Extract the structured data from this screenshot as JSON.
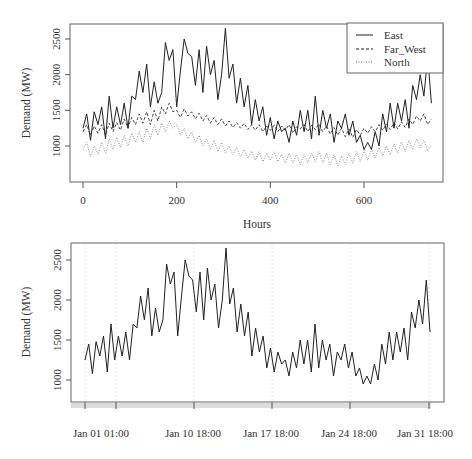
{
  "chart_data": [
    {
      "type": "line",
      "title": "",
      "xlabel": "Hours",
      "ylabel": "Demand (MW)",
      "xlim": [
        0,
        744
      ],
      "ylim": [
        700,
        2650
      ],
      "x_ticks": [
        "0",
        "200",
        "400",
        "600"
      ],
      "y_ticks": [
        "1000",
        "1500",
        "2000",
        "2500"
      ],
      "grid": false,
      "legend": {
        "position": "top-right",
        "entries": [
          {
            "label": "East",
            "style": "solid"
          },
          {
            "label": "Far_West",
            "style": "dashed"
          },
          {
            "label": "North",
            "style": "dotted"
          }
        ]
      },
      "x": [
        0,
        8,
        16,
        24,
        32,
        40,
        48,
        56,
        64,
        72,
        80,
        88,
        96,
        104,
        112,
        120,
        128,
        136,
        144,
        152,
        160,
        168,
        176,
        184,
        192,
        200,
        208,
        216,
        224,
        232,
        240,
        248,
        256,
        264,
        272,
        280,
        288,
        296,
        304,
        312,
        320,
        328,
        336,
        344,
        352,
        360,
        368,
        376,
        384,
        392,
        400,
        408,
        416,
        424,
        432,
        440,
        448,
        456,
        464,
        472,
        480,
        488,
        496,
        504,
        512,
        520,
        528,
        536,
        544,
        552,
        560,
        568,
        576,
        584,
        592,
        600,
        608,
        616,
        624,
        632,
        640,
        648,
        656,
        664,
        672,
        680,
        688,
        696,
        704,
        712,
        720,
        728,
        736,
        744
      ],
      "series": [
        {
          "name": "East",
          "values": [
            1250,
            1450,
            1080,
            1480,
            1300,
            1550,
            1100,
            1700,
            1250,
            1550,
            1300,
            1600,
            1250,
            1700,
            1650,
            2050,
            1750,
            2150,
            1550,
            1900,
            1600,
            1750,
            2450,
            2200,
            2350,
            1550,
            2050,
            2500,
            2300,
            2250,
            1850,
            2350,
            1750,
            2400,
            2000,
            2200,
            1650,
            2000,
            2650,
            1950,
            2150,
            1600,
            1950,
            1550,
            1850,
            1300,
            1650,
            1350,
            1550,
            1150,
            1400,
            1100,
            1350,
            1200,
            1250,
            1050,
            1350,
            1150,
            1500,
            1200,
            1500,
            1100,
            1700,
            1150,
            1500,
            1250,
            1450,
            1050,
            1350,
            1250,
            1450,
            1150,
            1350,
            1050,
            1150,
            950,
            1050,
            950,
            1200,
            1000,
            1450,
            1200,
            1600,
            1250,
            1600,
            1350,
            1650,
            1250,
            1850,
            1650,
            2000,
            1700,
            2250,
            1600
          ]
        },
        {
          "name": "Far_West",
          "values": [
            1200,
            1300,
            1150,
            1280,
            1180,
            1300,
            1150,
            1320,
            1200,
            1330,
            1220,
            1380,
            1250,
            1400,
            1300,
            1450,
            1320,
            1480,
            1300,
            1500,
            1350,
            1550,
            1450,
            1600,
            1480,
            1500,
            1400,
            1520,
            1420,
            1480,
            1380,
            1460,
            1350,
            1430,
            1320,
            1400,
            1300,
            1380,
            1280,
            1350,
            1260,
            1330,
            1250,
            1320,
            1230,
            1300,
            1220,
            1300,
            1200,
            1280,
            1220,
            1290,
            1200,
            1280,
            1220,
            1300,
            1180,
            1270,
            1240,
            1300,
            1200,
            1290,
            1230,
            1310,
            1200,
            1280,
            1170,
            1260,
            1150,
            1250,
            1130,
            1240,
            1120,
            1230,
            1150,
            1250,
            1180,
            1270,
            1200,
            1300,
            1220,
            1310,
            1230,
            1330,
            1240,
            1340,
            1260,
            1380,
            1300,
            1420,
            1350,
            1450,
            1300,
            1380
          ]
        },
        {
          "name": "North",
          "values": [
            950,
            1050,
            850,
            1000,
            880,
            1050,
            900,
            1100,
            950,
            1120,
            980,
            1150,
            1000,
            1180,
            1050,
            1200,
            1050,
            1250,
            1100,
            1300,
            1150,
            1320,
            1200,
            1350,
            1250,
            1300,
            1150,
            1250,
            1100,
            1200,
            1050,
            1150,
            1000,
            1100,
            950,
            1080,
            920,
            1050,
            900,
            1000,
            880,
            980,
            850,
            950,
            830,
            930,
            800,
            920,
            780,
            900,
            800,
            920,
            780,
            880,
            760,
            900,
            760,
            880,
            740,
            880,
            760,
            900,
            780,
            920,
            760,
            900,
            740,
            880,
            720,
            860,
            740,
            900,
            760,
            920,
            780,
            940,
            800,
            960,
            830,
            980,
            860,
            1000,
            880,
            1030,
            900,
            1060,
            920,
            1080,
            950,
            1100,
            980,
            1080,
            930,
            1020
          ]
        }
      ]
    },
    {
      "type": "line",
      "title": "",
      "xlabel": "",
      "ylabel": "Demand (MW)",
      "ylim": [
        700,
        2650
      ],
      "x_ticks": [
        "Jan 01 01:00",
        "Jan 10 18:00",
        "Jan 17 18:00",
        "Jan 24 18:00",
        "Jan 31 18:00"
      ],
      "y_ticks": [
        "1000",
        "1500",
        "2000",
        "2500"
      ],
      "grid": "faint vertical lines at tick positions",
      "series_ref": "East",
      "series": [
        {
          "name": "East",
          "values_same_as": "chart_data.0.series.0"
        }
      ]
    }
  ],
  "top": {
    "ylabel": "Demand (MW)",
    "xlabel": "Hours",
    "yticks": [
      "1000",
      "1500",
      "2000",
      "2500"
    ],
    "xticks": [
      "0",
      "200",
      "400",
      "600"
    ],
    "legend": [
      "East",
      "Far_West",
      "North"
    ]
  },
  "bottom": {
    "ylabel": "Demand (MW)",
    "yticks": [
      "1000",
      "1500",
      "2000",
      "2500"
    ],
    "xticks": [
      "Jan 01 01:00",
      "Jan 10 18:00",
      "Jan 17 18:00",
      "Jan 24 18:00",
      "Jan 31 18:00"
    ]
  },
  "colors": {
    "line": "#222222",
    "axis": "#555555",
    "grid": "#dddddd",
    "strip": "#d8d8d8"
  }
}
